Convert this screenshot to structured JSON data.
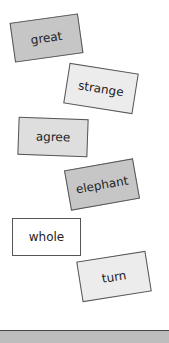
{
  "cards": [
    {
      "label": "great",
      "fill": "#c6c6c6"
    },
    {
      "label": "strange",
      "fill": "#ececec"
    },
    {
      "label": "agree",
      "fill": "#dedede"
    },
    {
      "label": "elephant",
      "fill": "#c6c6c6"
    },
    {
      "label": "whole",
      "fill": "#ffffff"
    },
    {
      "label": "turn",
      "fill": "#ececec"
    }
  ]
}
